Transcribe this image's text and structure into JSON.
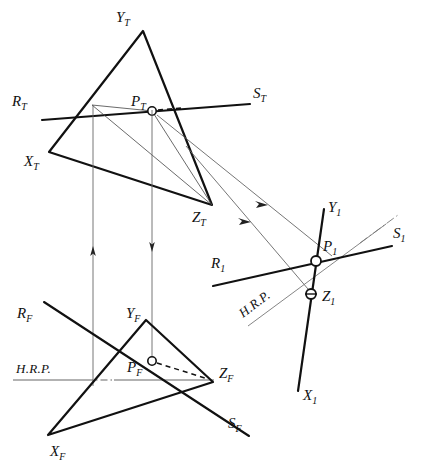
{
  "figure": {
    "background_color": "#ffffff",
    "ink_color": "#111111",
    "thin_ink_color": "#555555"
  },
  "views": {
    "top": {
      "name": "top-view",
      "labels": {
        "x": "X",
        "x_sub": "T",
        "y": "Y",
        "y_sub": "T",
        "z": "Z",
        "z_sub": "T",
        "r": "R",
        "r_sub": "T",
        "s": "S",
        "s_sub": "T",
        "p": "P",
        "p_sub": "T"
      }
    },
    "front": {
      "name": "front-view",
      "labels": {
        "x": "X",
        "x_sub": "F",
        "y": "Y",
        "y_sub": "F",
        "z": "Z",
        "z_sub": "F",
        "r": "R",
        "r_sub": "F",
        "s": "S",
        "s_sub": "F",
        "p": "P",
        "p_sub": "F",
        "hrp": "H.R.P."
      }
    },
    "auxiliary": {
      "name": "auxiliary-view",
      "labels": {
        "x": "X",
        "x_sub": "1",
        "y": "Y",
        "y_sub": "1",
        "z": "Z",
        "z_sub": "1",
        "r": "R",
        "r_sub": "1",
        "s": "S",
        "s_sub": "1",
        "p": "P",
        "p_sub": "1",
        "hrp": "H.R.P."
      }
    }
  },
  "geometry": {
    "top_view": {
      "triangle": [
        [
          49,
          152
        ],
        [
          143,
          31
        ],
        [
          212,
          205
        ]
      ],
      "rs_line": [
        [
          42,
          120
        ],
        [
          250,
          104
        ]
      ],
      "point_p": [
        152,
        111
      ],
      "point_p_radius": 4.2,
      "thin_edges": [
        [
          [
            92,
            105
          ],
          [
            212,
            205
          ]
        ],
        [
          [
            152,
            111
          ],
          [
            92,
            105
          ]
        ]
      ],
      "dash_to_p": [
        [
          152,
          111
        ],
        [
          176,
          107
        ]
      ]
    },
    "front_view": {
      "triangle": [
        [
          48,
          435
        ],
        [
          146,
          320
        ],
        [
          213,
          382
        ]
      ],
      "rs_line": [
        [
          44,
          302
        ],
        [
          249,
          436
        ]
      ],
      "point_p": [
        152,
        361
      ],
      "point_p_radius": 4.2,
      "hrp_line": [
        [
          13,
          380
        ],
        [
          213,
          380
        ]
      ],
      "hrp_dash": [
        [
          88,
          380
        ],
        [
          110,
          380
        ]
      ],
      "dash_to_p": [
        [
          152,
          361
        ],
        [
          210,
          380
        ]
      ]
    },
    "auxiliary_view": {
      "xy_line": [
        [
          323,
          210
        ],
        [
          298,
          390
        ]
      ],
      "rs_line": [
        [
          213,
          285
        ],
        [
          400,
          244
        ]
      ],
      "hrp_line": [
        [
          248,
          322
        ],
        [
          395,
          216
        ]
      ],
      "point_p": [
        316,
        261
      ],
      "point_p_radius": 5.0,
      "point_z": [
        311,
        294
      ],
      "point_z_radius": 5.0
    },
    "projectors": {
      "vertical_left": {
        "x": 93,
        "y1": 105,
        "y2": 386,
        "arrow": "up",
        "arrow_y": 252
      },
      "vertical_right": {
        "x": 152,
        "y1": 110,
        "y2": 362,
        "arrow": "down",
        "arrow_y": 248
      },
      "transfer_p": {
        "from": [
          152,
          111
        ],
        "to": [
          316,
          261
        ],
        "arrow_at": 0.62
      },
      "transfer_z": {
        "from": [
          212,
          205
        ],
        "to": [
          311,
          294
        ],
        "arrow_at": 0.55
      },
      "transfer_p_long": {
        "from": [
          158,
          117
        ],
        "to": [
          330,
          256
        ]
      },
      "transfer_z_long": {
        "from": [
          188,
          147
        ],
        "to": [
          308,
          288
        ]
      }
    }
  }
}
